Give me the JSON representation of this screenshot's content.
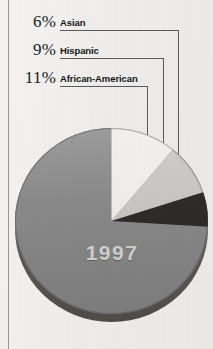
{
  "figure": {
    "year_label": "1997",
    "background_color": "#f1f0ee",
    "rule_color": "#9a9894"
  },
  "labels": [
    {
      "percent": "6%",
      "name": "Asian",
      "color": "#2e2d2c"
    },
    {
      "percent": "9%",
      "name": "Hispanic",
      "color": "#c9c8c4"
    },
    {
      "percent": "11%",
      "name": "African-American",
      "color": "#f0efec"
    }
  ],
  "chart_data": {
    "type": "pie",
    "title": "1997",
    "categories": [
      "African-American",
      "Hispanic",
      "Asian",
      "Other"
    ],
    "values": [
      11,
      9,
      6,
      74
    ],
    "labels_shown": [
      "11%",
      "9%",
      "6%",
      ""
    ],
    "colors": [
      "#f0efec",
      "#c9c8c4",
      "#2e2d2c",
      "#8a8a8a"
    ],
    "start_angle_deg": 0,
    "direction": "clockwise",
    "legend": "leader-lines-above-chart",
    "grid": false
  }
}
